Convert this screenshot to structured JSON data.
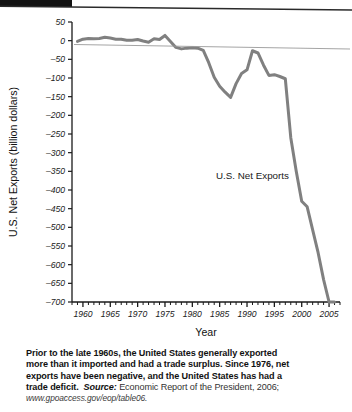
{
  "figure": {
    "annotation": "U.S. Net Exports"
  },
  "caption": {
    "line1": "Prior to the late 1960s, the United States generally exported",
    "line2": "more than it imported and had a trade surplus. Since 1976, net",
    "line3": "exports have been negative, and the United States has had a",
    "line4_lead": "trade deficit.",
    "source_label": "Source:",
    "source_text": "Economic Report of the President, 2006;",
    "url": "www.gpoaccess.gov/eop/table06."
  },
  "chart_data": {
    "type": "line",
    "title": "",
    "xlabel": "Year",
    "ylabel": "U.S. Net Exports (billion dollars)",
    "xlim": [
      1958,
      2007
    ],
    "ylim": [
      -700,
      50
    ],
    "yticks": [
      50,
      0,
      -50,
      -100,
      -150,
      -200,
      -250,
      -300,
      -350,
      -400,
      -450,
      -500,
      -550,
      -600,
      -650,
      -700
    ],
    "ytick_labels": [
      "50",
      "0",
      "–50",
      "–100",
      "–150",
      "–200",
      "–250",
      "–300",
      "–350",
      "–400",
      "–450",
      "–500",
      "–550",
      "–600",
      "–650",
      "–700"
    ],
    "xticks": [
      1960,
      1965,
      1970,
      1975,
      1980,
      1985,
      1990,
      1995,
      2000,
      2005
    ],
    "xtick_labels": [
      "1960",
      "1965",
      "1970",
      "1975",
      "1980",
      "1985",
      "1990",
      "1995",
      "2000",
      "2005"
    ],
    "xminor_step": 1,
    "grid": false,
    "legend": "none",
    "line_color": "#808080",
    "line_width": 3.0,
    "annotations": [
      {
        "text": "U.S. Net Exports",
        "x": 1991,
        "y": -370
      }
    ],
    "series": [
      {
        "name": "U.S. Net Exports",
        "x": [
          1959,
          1960,
          1961,
          1962,
          1963,
          1964,
          1965,
          1966,
          1967,
          1968,
          1969,
          1970,
          1971,
          1972,
          1973,
          1974,
          1975,
          1976,
          1977,
          1978,
          1979,
          1980,
          1981,
          1982,
          1983,
          1984,
          1985,
          1986,
          1987,
          1988,
          1989,
          1990,
          1991,
          1992,
          1993,
          1994,
          1995,
          1996,
          1997,
          1998,
          1999,
          2000,
          2001,
          2002,
          2003,
          2004,
          2005,
          2006
        ],
        "values": [
          -2,
          4,
          6,
          5,
          6,
          9,
          7,
          4,
          4,
          1,
          1,
          3,
          -1,
          -4,
          5,
          3,
          14,
          -2,
          -18,
          -22,
          -20,
          -19,
          -20,
          -26,
          -59,
          -98,
          -122,
          -138,
          -152,
          -115,
          -88,
          -78,
          -27,
          -33,
          -65,
          -93,
          -91,
          -96,
          -102,
          -260,
          -350,
          -430,
          -445,
          -507,
          -568,
          -640,
          -700,
          -700
        ]
      }
    ]
  }
}
